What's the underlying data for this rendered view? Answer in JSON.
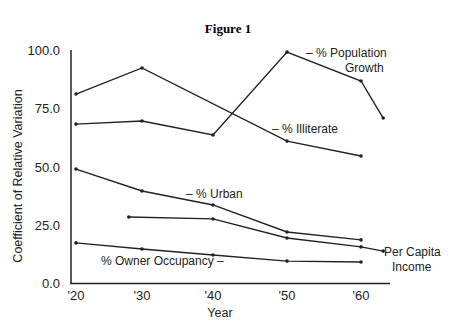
{
  "title": "Figure 1",
  "chart_data": {
    "type": "line",
    "title": "Figure 1",
    "xlabel": "Year",
    "ylabel": "Coefficient of Relative Variation",
    "ylim": [
      0,
      100
    ],
    "yticks": [
      0.0,
      25.0,
      50.0,
      75.0,
      100.0
    ],
    "ytick_labels": [
      "0.0",
      "25.0",
      "50.0",
      "75.0",
      "100.0"
    ],
    "xticks": [
      1920,
      1930,
      1940,
      1950,
      1960
    ],
    "xtick_labels": [
      "'20",
      "'30",
      "'40",
      "'50",
      "'60"
    ],
    "grid": false,
    "legend": "inline labels",
    "series": [
      {
        "name": "% Population Growth",
        "label_line1": "– %  Population",
        "label_line2": "Growth",
        "points": [
          [
            1920,
            68.2
          ],
          [
            1930,
            69.5
          ],
          [
            1940,
            63.5
          ],
          [
            1950,
            99.1
          ],
          [
            1960,
            86.7
          ],
          [
            1963,
            70.8
          ]
        ]
      },
      {
        "name": "% Illiterate",
        "label_line1": "– % Illiterate",
        "points": [
          [
            1920,
            81.1
          ],
          [
            1930,
            92.3
          ],
          [
            1950,
            60.9
          ],
          [
            1960,
            54.5
          ]
        ]
      },
      {
        "name": "% Urban",
        "label_line1": "– % Urban",
        "points": [
          [
            1920,
            48.9
          ],
          [
            1930,
            39.5
          ],
          [
            1940,
            33.5
          ],
          [
            1950,
            21.9
          ],
          [
            1960,
            18.5
          ]
        ]
      },
      {
        "name": "Per Capita Income",
        "label_line1": "Per Capita",
        "label_line2": "Income",
        "points": [
          [
            1928,
            28.3
          ],
          [
            1940,
            27.5
          ],
          [
            1950,
            19.3
          ],
          [
            1960,
            15.5
          ],
          [
            1963,
            13.7
          ]
        ]
      },
      {
        "name": "% Owner Occupancy",
        "label_line1": "% Owner Occupancy  –",
        "points": [
          [
            1920,
            17.2
          ],
          [
            1930,
            14.6
          ],
          [
            1940,
            12.0
          ],
          [
            1950,
            9.4
          ],
          [
            1960,
            9.0
          ]
        ]
      }
    ]
  }
}
